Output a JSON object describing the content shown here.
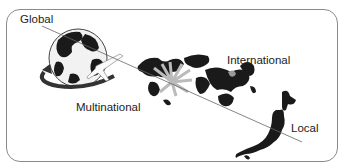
{
  "diagram": {
    "labels": {
      "global": "Global",
      "multinational": "Multinational",
      "international": "International",
      "local": "Local"
    },
    "icons": {
      "globe": "globe-with-airplane-icon",
      "world_map": "world-map-with-arrows-icon",
      "japan": "japan-map-icon"
    },
    "colors": {
      "frame": "#8a8a8a",
      "line": "#666666",
      "land": "#1a1a1a",
      "text": "#222222"
    }
  }
}
